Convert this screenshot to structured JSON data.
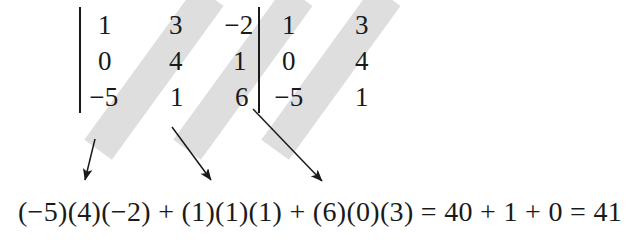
{
  "figure": {
    "kind": "determinant-sarrus-diagram",
    "colors": {
      "band": "#dedede",
      "ink": "#1a1a1a",
      "background": "#ffffff"
    }
  },
  "matrix": {
    "columns": 5,
    "rows": 3,
    "divider_after_column": 3,
    "cells": [
      [
        "1",
        "3",
        "−2",
        "1",
        "3"
      ],
      [
        "0",
        "4",
        "1",
        "0",
        "4"
      ],
      [
        "−5",
        "1",
        "6",
        "−5",
        "1"
      ]
    ]
  },
  "bands": [
    {
      "label": "diagonal-1",
      "terms": [
        "−5",
        "4",
        "−2"
      ]
    },
    {
      "label": "diagonal-2",
      "terms": [
        "1",
        "1",
        "1"
      ]
    },
    {
      "label": "diagonal-3",
      "terms": [
        "6",
        "0",
        "3"
      ]
    }
  ],
  "arrows": [
    {
      "label": "arrow-diagonal-1"
    },
    {
      "label": "arrow-diagonal-2"
    },
    {
      "label": "arrow-diagonal-3"
    }
  ],
  "equation": {
    "text": "(−5)(4)(−2) + (1)(1)(1) + (6)(0)(3) = 40 + 1 + 0 = 41",
    "terms": [
      "(−5)(4)(−2)",
      "(1)(1)(1)",
      "(6)(0)(3)"
    ],
    "products": [
      "40",
      "1",
      "0"
    ],
    "result": "41"
  }
}
